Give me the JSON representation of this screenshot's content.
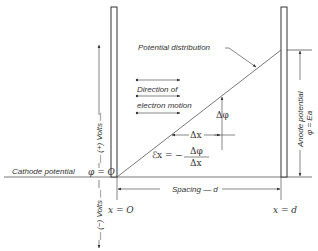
{
  "diagram": {
    "labels": {
      "potential_distribution": "Potential distribution",
      "direction_line1": "Direction of",
      "direction_line2": "electron motion",
      "delta_phi": "Δφ",
      "delta_x": "Δx",
      "field_lhs": "ℰx = −",
      "field_num": "Δφ",
      "field_den": "Δx",
      "cathode_potential": "Cathode potential",
      "phi_zero": "φ = O",
      "plus_volts": "— (+) Volts —",
      "minus_volts": "— (−) Volts —",
      "x_zero": "x = O",
      "x_d": "x = d",
      "spacing": "Spacing — d",
      "anode_potential": "Anode potential",
      "anode_phi": "φ = Ea"
    },
    "elements": {
      "cathode": "cathode-plate",
      "anode": "anode-plate"
    },
    "colors": {
      "line": "#333333",
      "background": "#ffffff"
    }
  }
}
